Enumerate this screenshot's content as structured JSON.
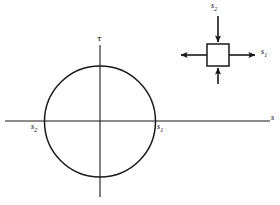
{
  "figure": {
    "type": "mohrs-circle-diagram",
    "stroke_color": "#1a1a1a",
    "background_color": "#ffffff"
  },
  "mohr_circle": {
    "center": {
      "x": 100,
      "y": 121
    },
    "radius": 55,
    "horizontal_axis": {
      "label": "s",
      "from_x": 5,
      "to_x": 270,
      "y": 121
    },
    "vertical_axis": {
      "label": "τ",
      "x": 100,
      "from_y": 45,
      "to_y": 197
    },
    "points": [
      {
        "name": "s2",
        "label_base": "s",
        "label_sub": "2",
        "x": 45,
        "y": 121
      },
      {
        "name": "s1",
        "label_base": "s",
        "label_sub": "1",
        "x": 155,
        "y": 121
      }
    ]
  },
  "stress_element": {
    "square": {
      "x": 207,
      "y": 44,
      "size": 22
    },
    "arrows": [
      {
        "name": "s1-right",
        "direction": "right",
        "sense": "outward",
        "label_base": "s",
        "label_sub": "1"
      },
      {
        "name": "s1-left",
        "direction": "left",
        "sense": "outward",
        "label_base": "",
        "label_sub": ""
      },
      {
        "name": "s2-top",
        "direction": "down",
        "sense": "inward",
        "label_base": "s",
        "label_sub": "2"
      },
      {
        "name": "s2-bottom",
        "direction": "up",
        "sense": "inward",
        "label_base": "",
        "label_sub": ""
      }
    ],
    "labels": {
      "top": {
        "base": "s",
        "sub": "2"
      },
      "right": {
        "base": "s",
        "sub": "1"
      }
    }
  },
  "labels": {
    "sigma_axis": "s",
    "tau_axis": "τ",
    "s_base": "s",
    "sub_one": "1",
    "sub_two": "2"
  }
}
